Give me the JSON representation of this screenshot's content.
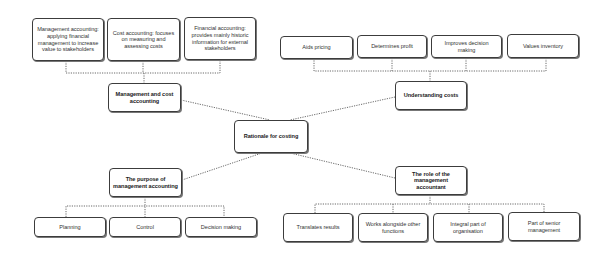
{
  "center": {
    "label": "Rationale for costing"
  },
  "branches": {
    "top_left": {
      "label": "Management and cost accounting",
      "children": [
        "Management accounting: applying financial management to increase value to stakeholders",
        "Cost accounting: focuses on measuring and assessing costs",
        "Financial accounting: provides mainly historic information for external stakeholders"
      ]
    },
    "top_right": {
      "label": "Understanding costs",
      "children": [
        "Aids pricing",
        "Determines profit",
        "Improves decision making",
        "Values inventory"
      ]
    },
    "bottom_left": {
      "label": "The purpose of management accounting",
      "children": [
        "Planning",
        "Control",
        "Decision making"
      ]
    },
    "bottom_right": {
      "label": "The role of the management accountant",
      "children": [
        "Translates results",
        "Works alongside other functions",
        "Integral part of organisation",
        "Part of senior management"
      ]
    }
  },
  "colors": {
    "border": "#3c3c3c",
    "text": "#333333",
    "connector": "#6a6a6a",
    "background": "#ffffff"
  }
}
